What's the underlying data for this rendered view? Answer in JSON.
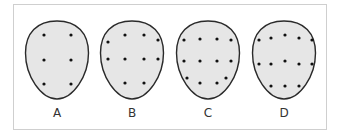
{
  "figure": {
    "colors": {
      "shape_fill": "#e6e6e6",
      "shape_stroke": "#2a2a2a",
      "dot": "#111111",
      "frame_border": "#cfcfcf",
      "label": "#333333"
    },
    "panels": [
      {
        "label": "A",
        "center_x": 57,
        "dots": [
          [
            44,
            35
          ],
          [
            71,
            35
          ],
          [
            44,
            60
          ],
          [
            71,
            60
          ],
          [
            44,
            84
          ],
          [
            71,
            84
          ]
        ]
      },
      {
        "label": "B",
        "center_x": 132,
        "dots": [
          [
            108,
            42
          ],
          [
            125,
            35
          ],
          [
            144,
            35
          ],
          [
            158,
            40
          ],
          [
            108,
            59
          ],
          [
            125,
            59
          ],
          [
            144,
            59
          ],
          [
            158,
            59
          ],
          [
            125,
            83
          ],
          [
            144,
            83
          ]
        ]
      },
      {
        "label": "C",
        "center_x": 208,
        "dots": [
          [
            184,
            40
          ],
          [
            200,
            39
          ],
          [
            217,
            39
          ],
          [
            231,
            40
          ],
          [
            184,
            61
          ],
          [
            200,
            61
          ],
          [
            217,
            61
          ],
          [
            231,
            61
          ],
          [
            187,
            78
          ],
          [
            200,
            83
          ],
          [
            217,
            83
          ],
          [
            226,
            78
          ]
        ]
      },
      {
        "label": "D",
        "center_x": 284,
        "dots": [
          [
            259,
            40
          ],
          [
            271,
            38
          ],
          [
            285,
            35
          ],
          [
            299,
            38
          ],
          [
            312,
            40
          ],
          [
            259,
            64
          ],
          [
            271,
            64
          ],
          [
            285,
            61
          ],
          [
            299,
            64
          ],
          [
            312,
            64
          ],
          [
            271,
            86
          ],
          [
            285,
            86
          ],
          [
            299,
            86
          ]
        ]
      }
    ]
  }
}
